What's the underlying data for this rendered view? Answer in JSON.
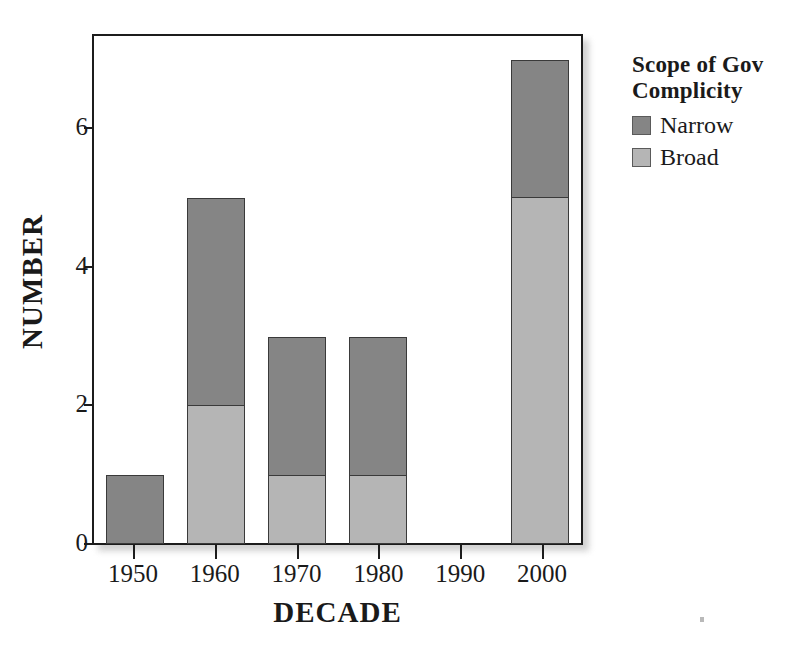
{
  "chart_data": {
    "type": "bar",
    "subtype": "stacked-vertical",
    "title": "",
    "xlabel": "DECADE",
    "ylabel": "NUMBER",
    "categories": [
      "1950",
      "1960",
      "1970",
      "1980",
      "1990",
      "2000"
    ],
    "series": [
      {
        "name": "Narrow",
        "color": "#858585",
        "values": [
          1,
          3,
          2,
          2,
          0,
          2
        ]
      },
      {
        "name": "Broad",
        "color": "#b5b5b5",
        "values": [
          0,
          2,
          1,
          1,
          0,
          5
        ]
      }
    ],
    "stack_order_bottom_to_top": [
      "Broad",
      "Narrow"
    ],
    "totals": [
      1,
      5,
      3,
      3,
      0,
      7
    ],
    "ylim": [
      0,
      7.3
    ],
    "yticks": [
      0,
      2,
      4,
      6
    ],
    "ytick_labels": [
      "0",
      "2",
      "4",
      "6"
    ],
    "grid": false,
    "legend_position": "right",
    "legend_title": "Scope of Gov Complicity"
  },
  "axes": {
    "y_title": "NUMBER",
    "x_title": "DECADE",
    "y_tick_labels": [
      "0",
      "2",
      "4",
      "6"
    ],
    "x_tick_labels": [
      "1950",
      "1960",
      "1970",
      "1980",
      "1990",
      "2000"
    ]
  },
  "legend": {
    "title_line1": "Scope of Gov",
    "title_line2": "Complicity",
    "items": [
      {
        "label": "Narrow",
        "color": "#858585"
      },
      {
        "label": "Broad",
        "color": "#b5b5b5"
      }
    ]
  },
  "colors": {
    "narrow": "#858585",
    "broad": "#b5b5b5",
    "frame": "#1c1c1c",
    "background": "#ffffff",
    "text": "#1a1a1a"
  }
}
